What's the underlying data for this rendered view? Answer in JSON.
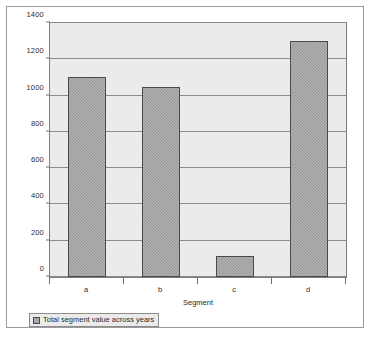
{
  "chart_data": {
    "type": "bar",
    "title": "",
    "subtitle": "",
    "categories": [
      "a",
      "b",
      "c",
      "d"
    ],
    "values": [
      1100,
      1045,
      115,
      1300
    ],
    "series": [
      {
        "name": "Total segment value across years",
        "values": [
          1100,
          1045,
          115,
          1300
        ]
      }
    ],
    "xlabel": "Segment",
    "ylabel": "",
    "ylim": [
      0,
      1400
    ],
    "ytick_labels": [
      "0",
      "200",
      "400",
      "600",
      "800",
      "1000",
      "1200",
      "1400"
    ],
    "ytick_values": [
      0,
      200,
      400,
      600,
      800,
      1000,
      1200,
      1400
    ],
    "grid": true,
    "legend_position": "bottom-left",
    "legend": [
      {
        "label": "Total segment value across years",
        "swatch_icon": "legend-swatch-icon",
        "color": "#989898"
      }
    ],
    "annotations": [],
    "colors": {
      "bar_fill": "#989898",
      "bar_border": "#4a4a4a",
      "plot_background": "#ebebeb",
      "gridline": "#8c8c8c",
      "frame_border": "#9a9a9a",
      "text": "#2b2b2b"
    }
  }
}
